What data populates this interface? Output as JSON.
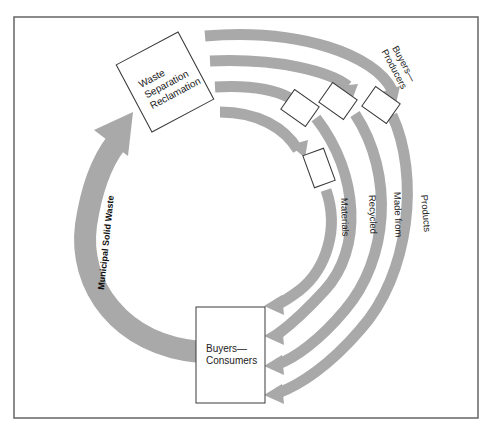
{
  "diagram": {
    "nodes": {
      "waste_separation": {
        "lines": [
          "Waste",
          "Separation",
          "Reclamation"
        ]
      },
      "buyers_producers": {
        "lines": [
          "Buyers—",
          "Producers"
        ]
      },
      "buyers_consumers": {
        "lines": [
          "Buyers—",
          "Consumers"
        ]
      }
    },
    "flows": {
      "municipal_solid_waste": "Municipal Solid Waste",
      "materials": "Materials",
      "recycled": "Recycled",
      "made_from": "Made from",
      "products": "Products"
    },
    "colors": {
      "arrow": "#a9a9a9",
      "box_stroke": "#3a3a3a",
      "frame": "#6e6e6e",
      "background": "#ffffff"
    }
  }
}
